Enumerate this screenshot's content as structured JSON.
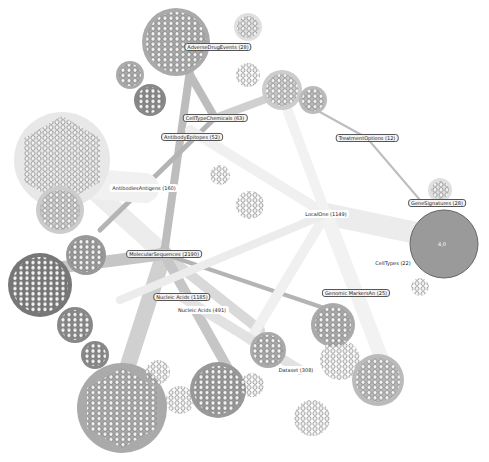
{
  "graph": {
    "title": "",
    "hub_nodes": [
      {
        "label": "AdverseDrugEvents (28)",
        "x": 218,
        "y": 47
      },
      {
        "label": "CellTypeChemicals (63)",
        "x": 215,
        "y": 118
      },
      {
        "label": "AntibodyEpitopes (52)",
        "x": 192,
        "y": 137
      },
      {
        "label": "TreatmentOptions (12)",
        "x": 367,
        "y": 138
      },
      {
        "label": "AntibodiesAntigens (160)",
        "x": 144,
        "y": 188
      },
      {
        "label": "GeneSignatures (28)",
        "x": 437,
        "y": 203
      },
      {
        "label": "LocalOne (1149)",
        "x": 326,
        "y": 214
      },
      {
        "label": "MolecularSequences (2190)",
        "x": 164,
        "y": 254
      },
      {
        "label": "CellTypes (22)",
        "x": 393,
        "y": 263
      },
      {
        "label": "Genomic MarkersAn (25)",
        "x": 356,
        "y": 293
      },
      {
        "label": "Nucleic Acids (1185)",
        "x": 182,
        "y": 297
      },
      {
        "label": "Nucleic Acids (491)",
        "x": 195,
        "y": 310
      },
      {
        "label": "Dataset (308)",
        "x": 293,
        "y": 370
      }
    ],
    "big_disc_label": "4,0"
  }
}
